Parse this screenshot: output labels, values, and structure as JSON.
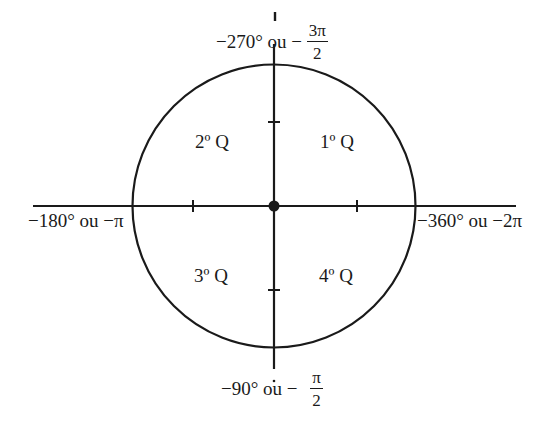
{
  "diagram": {
    "type": "trigonometric-circle",
    "colors": {
      "stroke": "#1a1a1a",
      "background": "#ffffff"
    },
    "quadrants": [
      {
        "id": "q1",
        "label": "1º Q"
      },
      {
        "id": "q2",
        "label": "2º Q"
      },
      {
        "id": "q3",
        "label": "3º Q"
      },
      {
        "id": "q4",
        "label": "4º Q"
      }
    ],
    "axis_labels": {
      "top": {
        "degrees": "−270° ou −",
        "frac_num": "3π",
        "frac_den": "2"
      },
      "bottom": {
        "degrees": "−90° ou −",
        "frac_num": "π",
        "frac_den": "2"
      },
      "left": {
        "text": "−180° ou −π"
      },
      "right": {
        "text": "−360° ou −2π"
      }
    }
  }
}
